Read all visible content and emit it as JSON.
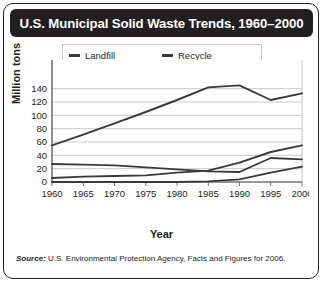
{
  "title": "U.S. Municipal Solid Waste Trends, 1960–2000",
  "source": {
    "label": "Source:",
    "text": " U.S. Environmental Protection Agency, Facts and Figures for 2006."
  },
  "legend": [
    {
      "label": "Landfill"
    },
    {
      "label": "Recycle"
    },
    {
      "label": "Incinerator"
    },
    {
      "label": "Composting"
    }
  ],
  "chart_data": {
    "type": "line",
    "title": "U.S. Municipal Solid Waste Trends, 1960–2000",
    "xlabel": "Year",
    "ylabel": "Million tons",
    "x": [
      1960,
      1965,
      1970,
      1975,
      1980,
      1985,
      1990,
      1995,
      2000
    ],
    "xticklabels": [
      "1960",
      "1965",
      "1970",
      "1975",
      "1980",
      "1985",
      "1990",
      "1995",
      "2000"
    ],
    "yticks": [
      0,
      20,
      40,
      60,
      80,
      100,
      120,
      140
    ],
    "yticklabels": [
      "0",
      "20",
      "40",
      "60",
      "80",
      "100",
      "120",
      "140"
    ],
    "xlim": [
      1960,
      2000
    ],
    "ylim": [
      0,
      150
    ],
    "grid": true,
    "legend_position": "top-center",
    "series": [
      {
        "name": "Landfill",
        "values": [
          55,
          71,
          88,
          105,
          123,
          142,
          145,
          123,
          133
        ]
      },
      {
        "name": "Recycle",
        "values": [
          6,
          8,
          9,
          10,
          14,
          17,
          29,
          45,
          55
        ]
      },
      {
        "name": "Incinerator",
        "values": [
          27,
          26,
          25,
          22,
          19,
          16,
          15,
          36,
          34
        ]
      },
      {
        "name": "Composting",
        "values": [
          0,
          0,
          0,
          0,
          0,
          1,
          4,
          14,
          23
        ]
      }
    ]
  }
}
